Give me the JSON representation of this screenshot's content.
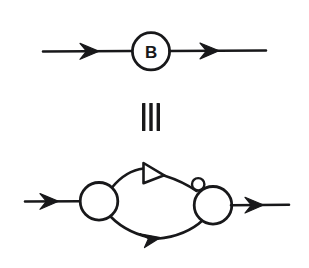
{
  "figure": {
    "kind": "signal-flow-graph-equivalence",
    "background_color": "#ffffff",
    "ink_color": "#18181a",
    "width": 309,
    "height": 268,
    "equivalence_symbol": "≡",
    "equivalence_symbol_name": "identical-to",
    "equivalence_bar_count": 3
  },
  "top_diagram": {
    "name": "block-b-form",
    "node_label": "B",
    "node_shape": "circle",
    "node_center": [
      151,
      51
    ],
    "node_radius": 19,
    "input_arrow": {
      "label": "",
      "from_x": 43,
      "to_x": 132,
      "y": 51,
      "head_x": 99,
      "direction": "right"
    },
    "output_arrow": {
      "label": "",
      "from_x": 170,
      "to_x": 266,
      "y": 51,
      "head_x": 219,
      "direction": "right"
    }
  },
  "bottom_diagram": {
    "name": "expanded-feedback-form",
    "left_node": {
      "label": "",
      "shape": "circle",
      "center": [
        99,
        201
      ],
      "radius": 19
    },
    "right_node": {
      "label": "",
      "shape": "circle",
      "center": [
        213,
        205
      ],
      "radius": 19
    },
    "inverter_bubble": {
      "label": "",
      "shape": "small-circle",
      "center": [
        198,
        184
      ],
      "radius": 6
    },
    "upper_branch": {
      "label": "",
      "element": "triangle-amplifier",
      "direction": "right",
      "triangle_back_x": 143,
      "triangle_apex_x": 164,
      "triangle_top_y": 163,
      "triangle_bottom_y": 183
    },
    "lower_branch": {
      "label": "",
      "element": "arrowhead",
      "direction": "right",
      "head_x": 158,
      "head_y": 238
    },
    "input_arrow": {
      "label": "",
      "from_x": 25,
      "to_x": 80,
      "y": 201,
      "head_x": 58,
      "direction": "right"
    },
    "output_arrow": {
      "label": "",
      "from_x": 232,
      "to_x": 289,
      "y": 205,
      "head_x": 263,
      "direction": "right"
    }
  },
  "labels": {
    "top_node_text": "B"
  }
}
